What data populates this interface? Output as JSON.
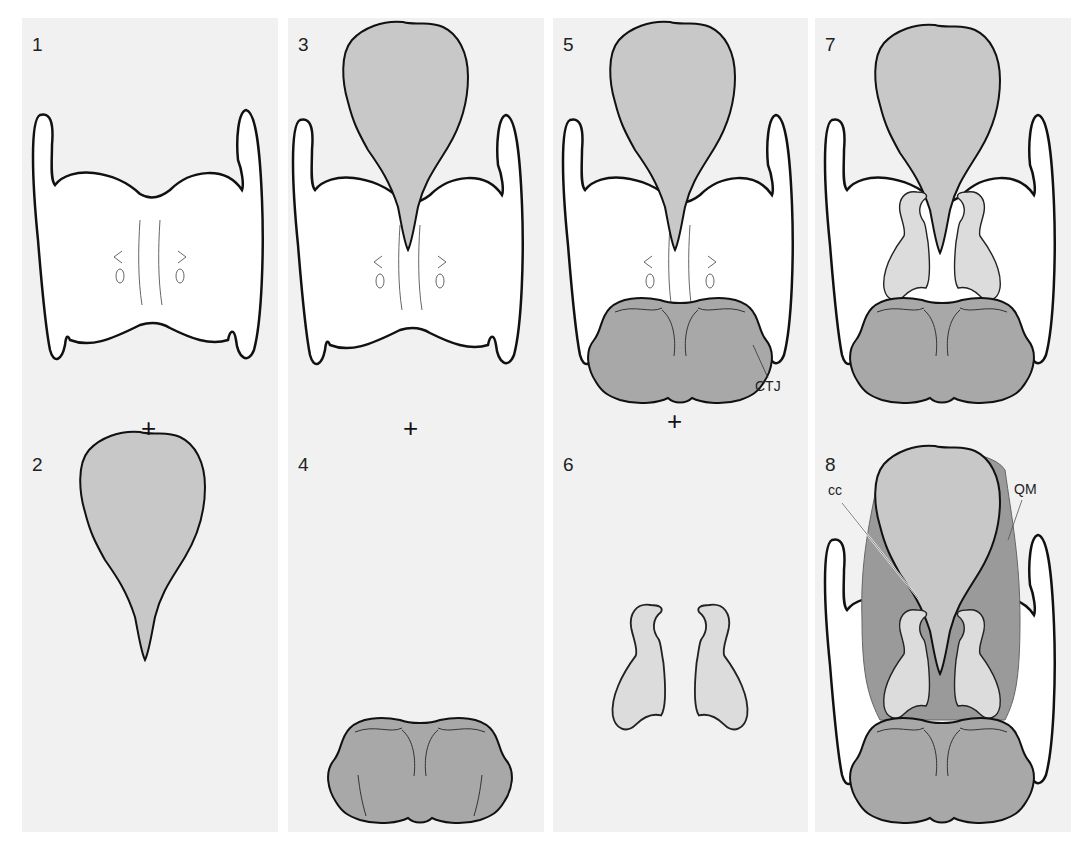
{
  "figure": {
    "panels": [
      {
        "column": 1,
        "steps": [
          "1",
          "2"
        ]
      },
      {
        "column": 2,
        "steps": [
          "3",
          "4"
        ]
      },
      {
        "column": 3,
        "steps": [
          "5",
          "6"
        ]
      },
      {
        "column": 4,
        "steps": [
          "7",
          "8"
        ]
      }
    ],
    "step_numbers": [
      "1",
      "2",
      "3",
      "4",
      "5",
      "6",
      "7",
      "8"
    ],
    "plus_sign": "+",
    "labels": {
      "ctj": "CTJ",
      "cc": "cc",
      "qm": "QM"
    },
    "colors": {
      "panel_bg": "#f1f1f1",
      "epiglottis": "#c8c8c8",
      "cricoid": "#a8a8a8",
      "arytenoid": "#dcdcdc",
      "quadrangular_membrane": "#9a9a9a",
      "thyroid": "#ffffff",
      "outline": "#111111"
    }
  }
}
